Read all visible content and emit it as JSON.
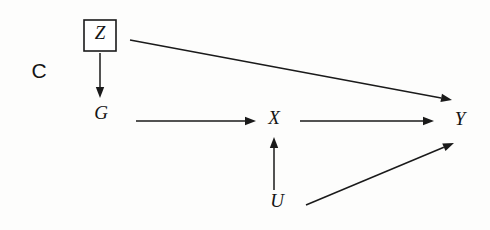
{
  "figure": {
    "panel_label": "C",
    "caption": "",
    "background_color": "#fdfdfc",
    "ink_color": "#1a1a1a"
  },
  "nodes": [
    {
      "id": "Z",
      "label": "Z",
      "x": 100,
      "y": 35,
      "boxed": true,
      "box": {
        "x": 84,
        "y": 20,
        "width": 32,
        "height": 31
      }
    },
    {
      "id": "G",
      "label": "G",
      "x": 101,
      "y": 115,
      "boxed": false
    },
    {
      "id": "X",
      "label": "X",
      "x": 274,
      "y": 120,
      "boxed": false
    },
    {
      "id": "Y",
      "label": "Y",
      "x": 460,
      "y": 121,
      "boxed": false
    },
    {
      "id": "U",
      "label": "U",
      "x": 277,
      "y": 203,
      "boxed": false
    }
  ],
  "edges": [
    {
      "id": "Z-G",
      "from": "Z",
      "to": "G",
      "x1": 100,
      "y1": 53,
      "x2": 100,
      "y2": 98,
      "label": ""
    },
    {
      "id": "Z-Y",
      "from": "Z",
      "to": "Y",
      "x1": 130,
      "y1": 40,
      "x2": 452,
      "y2": 100,
      "label": ""
    },
    {
      "id": "G-X",
      "from": "G",
      "to": "X",
      "x1": 136,
      "y1": 121,
      "x2": 256,
      "y2": 121,
      "label": ""
    },
    {
      "id": "X-Y",
      "from": "X",
      "to": "Y",
      "x1": 300,
      "y1": 121,
      "x2": 434,
      "y2": 121,
      "label": ""
    },
    {
      "id": "U-X",
      "from": "U",
      "to": "X",
      "x1": 274,
      "y1": 190,
      "x2": 274,
      "y2": 137,
      "label": ""
    },
    {
      "id": "U-Y",
      "from": "U",
      "to": "Y",
      "x1": 306,
      "y1": 205,
      "x2": 454,
      "y2": 143,
      "label": ""
    }
  ],
  "arrow_head": {
    "length": 11,
    "half_width": 4.2
  },
  "bleed_through_marks": [
    {
      "text": "",
      "x": 150,
      "y": 14
    },
    {
      "text": "",
      "x": 300,
      "y": 12
    }
  ]
}
